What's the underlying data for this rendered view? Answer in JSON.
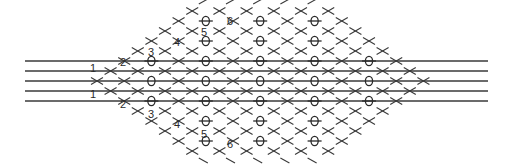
{
  "figure": {
    "line_count": 5,
    "level_labels_top": [
      "1",
      "2",
      "3",
      "4",
      "5",
      "6"
    ],
    "level_labels_bottom": [
      "1",
      "2",
      "3",
      "4",
      "5",
      "6"
    ],
    "symbols": {
      "node": "circle-with-bar",
      "crossing": "x-cross",
      "stub": "dash"
    },
    "max_level": 6,
    "ink_color": "#2a2a2a"
  }
}
